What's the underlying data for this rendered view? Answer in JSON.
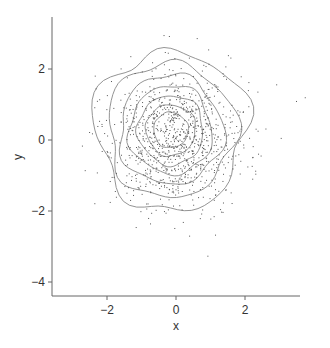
{
  "chart_data": {
    "type": "scatter",
    "subtype": "scatter_with_density_contours",
    "title": "",
    "xlabel": "x",
    "ylabel": "y",
    "xlim": [
      -3.6,
      3.6
    ],
    "ylim": [
      -4.3,
      3.5
    ],
    "xticks": [
      -2,
      0,
      2
    ],
    "xtick_labels": [
      "−2",
      "0",
      "2"
    ],
    "yticks": [
      -4,
      -2,
      0,
      2
    ],
    "ytick_labels": [
      "−4",
      "−2",
      "0",
      "2"
    ],
    "grid": false,
    "legend": null,
    "colors": {
      "points": "#555555",
      "contours": "#888888",
      "axis": "#666666",
      "text": "#333333"
    },
    "points": {
      "distribution": "bivariate normal (approx.)",
      "n": 1000,
      "mean": [
        0.0,
        0.0
      ],
      "sd": [
        1.0,
        1.0
      ],
      "seed": 42
    },
    "contours": {
      "center": [
        -0.15,
        0.28
      ],
      "levels": [
        {
          "rx": 2.2,
          "ry": 2.25,
          "wobble": 0.12
        },
        {
          "rx": 1.85,
          "ry": 1.9,
          "wobble": 0.1
        },
        {
          "rx": 1.5,
          "ry": 1.55,
          "wobble": 0.09
        },
        {
          "rx": 1.2,
          "ry": 1.25,
          "wobble": 0.08
        },
        {
          "rx": 0.95,
          "ry": 0.98,
          "wobble": 0.07
        },
        {
          "rx": 0.72,
          "ry": 0.72,
          "wobble": 0.06
        },
        {
          "rx": 0.5,
          "ry": 0.5,
          "wobble": 0.05
        }
      ]
    }
  }
}
